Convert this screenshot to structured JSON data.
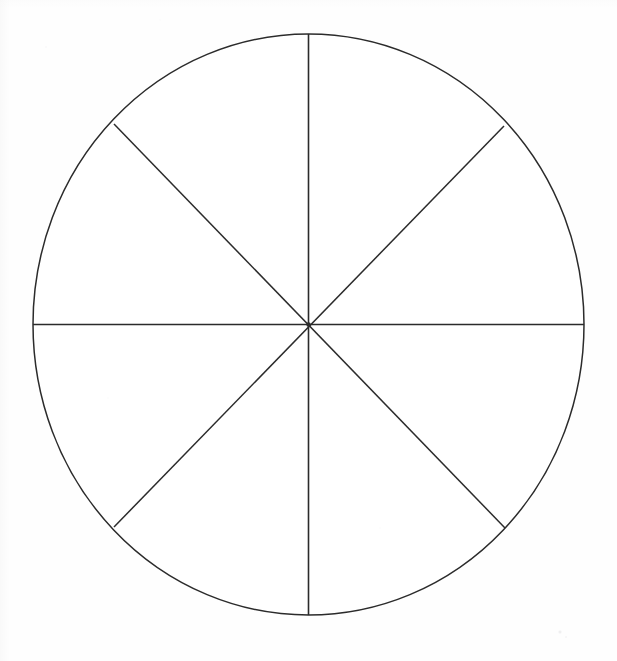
{
  "document": {
    "type": "geometric-figure",
    "title": "Circle divided into eight equal sectors",
    "background_color": "#fefefe",
    "stroke_color": "#2b2b2b",
    "medium": "scanned line drawing"
  },
  "chart_data": {
    "type": "pie",
    "categories": [
      "1",
      "2",
      "3",
      "4",
      "5",
      "6",
      "7",
      "8"
    ],
    "values": [
      12.5,
      12.5,
      12.5,
      12.5,
      12.5,
      12.5,
      12.5,
      12.5
    ],
    "labels": [],
    "legend": [],
    "xlabel": "",
    "ylabel": "",
    "grid": false,
    "legend_position": "none",
    "slice_count": 8,
    "slice_angle_degrees": 45,
    "fraction_per_slice": "1/8",
    "fill_color": "#ffffff",
    "stroke_color": "#2b2b2b",
    "stroke_width_px": 1.5
  },
  "figure": {
    "shape": "circle",
    "center": {
      "x": 308.5,
      "y": 324.5
    },
    "radius_x": 275.5,
    "radius_y": 290.5,
    "outline_color": "#2b2b2b",
    "outline_width": 1.5,
    "fill": "#ffffff",
    "divider_count": 4,
    "dividers": [
      {
        "name": "vertical-diameter",
        "angle_degrees": 90,
        "x1": 308.5,
        "y1": 34,
        "x2": 308.5,
        "y2": 615
      },
      {
        "name": "horizontal-diameter",
        "angle_degrees": 0,
        "x1": 33,
        "y1": 324.5,
        "x2": 584,
        "y2": 324.5
      },
      {
        "name": "diagonal-nw-se",
        "angle_degrees": 135,
        "x1": 114,
        "y1": 124,
        "x2": 505,
        "y2": 528
      },
      {
        "name": "diagonal-ne-sw",
        "angle_degrees": 45,
        "x1": 504,
        "y1": 126,
        "x2": 114,
        "y2": 527
      }
    ],
    "sector_endpoints": [
      {
        "name": "top",
        "x": 308.5,
        "y": 34
      },
      {
        "name": "top-right",
        "x": 504,
        "y": 126
      },
      {
        "name": "right",
        "x": 584,
        "y": 324.5
      },
      {
        "name": "bottom-right",
        "x": 505,
        "y": 528
      },
      {
        "name": "bottom",
        "x": 308.5,
        "y": 615
      },
      {
        "name": "bottom-left",
        "x": 114,
        "y": 527
      },
      {
        "name": "left",
        "x": 33,
        "y": 324.5
      },
      {
        "name": "top-left",
        "x": 114,
        "y": 124
      }
    ],
    "center_dot": {
      "x": 308.5,
      "y": 324.5,
      "radius": 2.2,
      "color": "#2b2b2b"
    }
  }
}
